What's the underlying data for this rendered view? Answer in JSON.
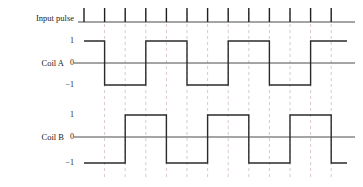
{
  "figure": {
    "title": "",
    "rows": [
      {
        "name": "input-pulse",
        "label": "Input pulse"
      },
      {
        "name": "coil-a",
        "label": "Coil A"
      },
      {
        "name": "coil-b",
        "label": "Coil B"
      }
    ],
    "axis_values": {
      "high": "1",
      "zero": "0",
      "low": "−1"
    },
    "colors": {
      "waveform": "#2b2b2b",
      "baseline": "#4a4a4a",
      "gridline": "#d9c9c9",
      "tick": "#1f1f1f",
      "text": "#1c1c1c",
      "background": "#ffffff"
    }
  },
  "chart_data": {
    "type": "line",
    "title": "",
    "xlabel": "",
    "ylabel": "",
    "x_unit": "pulse index",
    "pulse_count": 13,
    "pulse_indices": [
      1,
      2,
      3,
      4,
      5,
      6,
      7,
      8,
      9,
      10,
      11,
      12,
      13
    ],
    "gridline_indices": [
      2,
      3,
      4,
      5,
      6,
      7,
      8,
      9,
      10,
      11,
      12,
      13
    ],
    "ylim": [
      -1,
      1
    ],
    "ytick_values": [
      1,
      0,
      -1
    ],
    "ytick_labels": [
      "1",
      "0",
      "−1"
    ],
    "grid": true,
    "legend": false,
    "series": [
      {
        "name": "Input pulse",
        "kind": "pulse-train",
        "values": [
          1,
          1,
          1,
          1,
          1,
          1,
          1,
          1,
          1,
          1,
          1,
          1,
          1
        ]
      },
      {
        "name": "Coil A",
        "kind": "square",
        "period_pulses": 4,
        "phase_pulses": 0,
        "start_level": 1,
        "levels": [
          1,
          -1,
          -1,
          1,
          1,
          -1,
          -1,
          1,
          1,
          -1,
          -1,
          1,
          1
        ],
        "transitions": [
          {
            "at_pulse": 2,
            "to": -1
          },
          {
            "at_pulse": 4,
            "to": 1
          },
          {
            "at_pulse": 6,
            "to": -1
          },
          {
            "at_pulse": 8,
            "to": 1
          },
          {
            "at_pulse": 10,
            "to": -1
          },
          {
            "at_pulse": 12,
            "to": 1
          }
        ]
      },
      {
        "name": "Coil B",
        "kind": "square",
        "period_pulses": 4,
        "phase_pulses": 1,
        "start_level": -1,
        "levels": [
          -1,
          -1,
          1,
          1,
          -1,
          -1,
          1,
          1,
          -1,
          -1,
          1,
          1,
          -1
        ],
        "transitions": [
          {
            "at_pulse": 3,
            "to": 1
          },
          {
            "at_pulse": 5,
            "to": -1
          },
          {
            "at_pulse": 7,
            "to": 1
          },
          {
            "at_pulse": 9,
            "to": -1
          },
          {
            "at_pulse": 11,
            "to": 1
          },
          {
            "at_pulse": 13,
            "to": -1
          }
        ]
      }
    ]
  }
}
